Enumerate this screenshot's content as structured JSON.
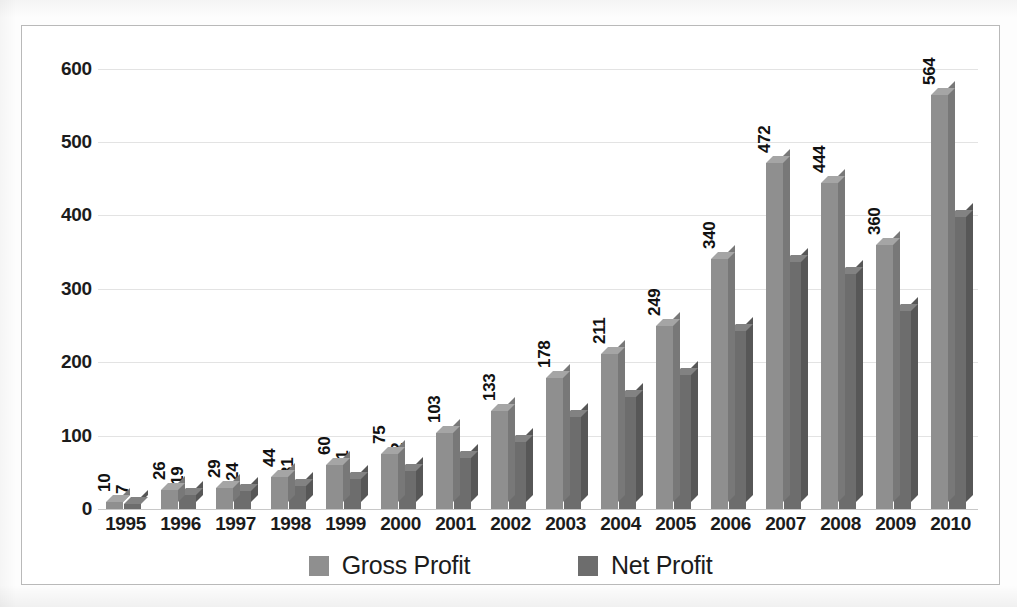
{
  "chart_data": {
    "type": "bar",
    "title": "",
    "subtitle": "",
    "xlabel": "",
    "ylabel": "",
    "categories": [
      "1995",
      "1996",
      "1997",
      "1998",
      "1999",
      "2000",
      "2001",
      "2002",
      "2003",
      "2004",
      "2005",
      "2006",
      "2007",
      "2008",
      "2009",
      "2010"
    ],
    "series": [
      {
        "name": "Gross Profit",
        "color": "#8f8f8f",
        "values": [
          10,
          26,
          29,
          44,
          60,
          75,
          103,
          133,
          178,
          211,
          249,
          340,
          472,
          444,
          360,
          564
        ]
      },
      {
        "name": "Net Profit",
        "color": "#6d6d6d",
        "values": [
          7,
          19,
          24,
          31,
          41,
          52,
          70,
          91,
          125,
          153,
          183,
          242,
          336,
          320,
          270,
          398
        ]
      }
    ],
    "yticks": [
      0,
      100,
      200,
      300,
      400,
      500,
      600
    ],
    "ytick_labels": [
      "0",
      "100",
      "200",
      "300",
      "400",
      "500",
      "600"
    ],
    "ylim": [
      0,
      620
    ],
    "grid": true,
    "data_labels": true,
    "data_label_rotation": -90,
    "legend_position": "bottom",
    "style_3d": true
  },
  "legend": {
    "items": [
      {
        "label": "Gross Profit",
        "color": "#8f8f8f"
      },
      {
        "label": "Net Profit",
        "color": "#6d6d6d"
      }
    ]
  }
}
